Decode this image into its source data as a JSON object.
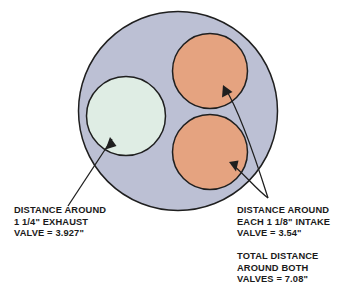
{
  "diagram": {
    "colors": {
      "cylinder_bore": "#bcc0d4",
      "exhaust_valve": "#dfede4",
      "intake_valve": "#e5a380",
      "outline": "#1f1f1f",
      "text": "#1a1a1a",
      "background": "#ffffff"
    },
    "shapes": [
      {
        "name": "cylinder-bore-circle",
        "role": "cylinder bore",
        "cx": 178,
        "cy": 111,
        "r": 99.5,
        "fill": "#bcc0d4"
      },
      {
        "name": "exhaust-valve-circle",
        "role": "1 1/4\" exhaust valve",
        "cx": 126,
        "cy": 116,
        "r": 39.5,
        "fill": "#dfede4"
      },
      {
        "name": "intake-valve-top-circle",
        "role": "1 1/8\" intake valve (upper)",
        "cx": 210,
        "cy": 71,
        "r": 37.5,
        "fill": "#e5a380"
      },
      {
        "name": "intake-valve-bottom-circle",
        "role": "1 1/8\" intake valve (lower)",
        "cx": 210,
        "cy": 152,
        "r": 37.5,
        "fill": "#e5a380"
      }
    ]
  },
  "callouts": {
    "exhaust": {
      "name": "exhaust-valve-callout",
      "line1": "DISTANCE AROUND",
      "line2": "1 1/4\" EXHAUST",
      "line3": "VALVE = 3.927\""
    },
    "intake": {
      "name": "intake-valve-callout",
      "line1": "DISTANCE AROUND",
      "line2": "EACH 1 1/8\" INTAKE",
      "line3": "VALVE = 3.54\""
    },
    "total": {
      "name": "total-distance-callout",
      "line1": "TOTAL DISTANCE",
      "line2": "AROUND BOTH",
      "line3": "VALVES = 7.08\""
    }
  },
  "measurements": {
    "exhaust_valve_diameter": "1 1/4\"",
    "exhaust_valve_circumference": "3.927\"",
    "intake_valve_diameter": "1 1/8\"",
    "intake_valve_circumference_each": "3.54\"",
    "intake_valves_total_circumference": "7.08\""
  }
}
